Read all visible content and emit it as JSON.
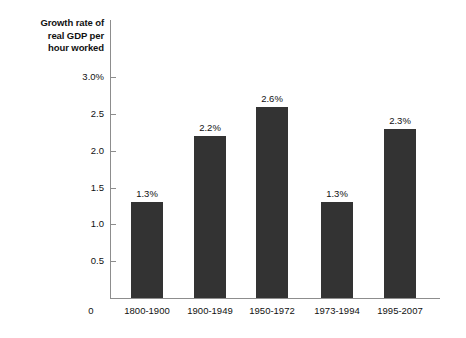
{
  "chart_data": {
    "type": "bar",
    "title": "Growth rate of real GDP per hour worked",
    "ylabel": "Growth rate of\nreal GDP per\nhour worked",
    "xlabel": "",
    "categories": [
      "1800-1900",
      "1900-1949",
      "1950-1972",
      "1973-1994",
      "1995-2007"
    ],
    "values": [
      1.3,
      2.2,
      2.6,
      1.3,
      2.3
    ],
    "value_labels": [
      "1.3%",
      "2.2%",
      "2.6%",
      "1.3%",
      "2.3%"
    ],
    "ytick_labels": [
      "3.0%",
      "2.5",
      "2.0",
      "1.5",
      "1.0",
      "0.5"
    ],
    "ytick_values": [
      3.0,
      2.5,
      2.0,
      1.5,
      1.0,
      0.5
    ],
    "origin_label": "0",
    "ylim": [
      0,
      3.2
    ],
    "grid": false,
    "legend": null,
    "bar_color": "#333333",
    "axis_color": "#8d8d8d",
    "text_color": "#111111",
    "background_color": "#ffffff"
  }
}
